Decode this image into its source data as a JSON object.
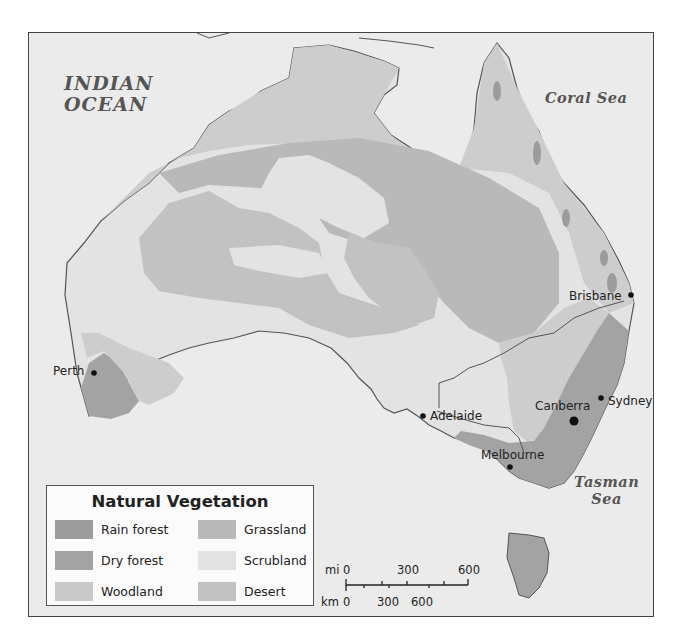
{
  "map": {
    "title": "Natural Vegetation",
    "water_labels": {
      "indian_ocean_line1": "INDIAN",
      "indian_ocean_line2": "OCEAN",
      "coral_sea": "Coral Sea",
      "tasman_sea_line1": "Tasman",
      "tasman_sea_line2": "Sea"
    },
    "cities": [
      {
        "name": "Perth"
      },
      {
        "name": "Adelaide"
      },
      {
        "name": "Melbourne"
      },
      {
        "name": "Canberra",
        "capital": true
      },
      {
        "name": "Sydney"
      },
      {
        "name": "Brisbane"
      }
    ],
    "legend": {
      "title": "Natural Vegetation",
      "items": [
        {
          "label": "Rain forest",
          "color": "#9c9c9c"
        },
        {
          "label": "Dry forest",
          "color": "#a3a3a3"
        },
        {
          "label": "Woodland",
          "color": "#c9c9c9"
        },
        {
          "label": "Grassland",
          "color": "#b9b9b9"
        },
        {
          "label": "Scrubland",
          "color": "#e3e3e3"
        },
        {
          "label": "Desert",
          "color": "#c2c2c2"
        }
      ]
    },
    "scale": {
      "mi_label": "mi",
      "km_label": "km",
      "mi_ticks": [
        "0",
        "300",
        "600"
      ],
      "km_ticks": [
        "0",
        "300",
        "600"
      ]
    },
    "colors": {
      "ocean": "#ebebeb",
      "outline": "#555555"
    }
  }
}
